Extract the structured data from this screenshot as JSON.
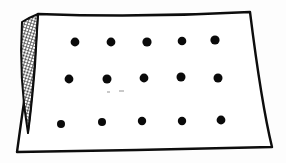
{
  "figure": {
    "kind": "line-drawing",
    "width": 286,
    "height": 163,
    "background_color": "#fdfdfd",
    "paper_fill_color": "#ffffff",
    "ink_color": "#0d0d0d",
    "shading_color": "#1a1a1a"
  },
  "sheet": {
    "name": "paper-sheet",
    "description": "Quadrilateral sheet of paper drawn freehand, slightly skewed",
    "outline_path": "M 38 14 L 250 12 L 272 147 L 17 152 Z",
    "corners": [
      {
        "label": "top-left",
        "x": 38,
        "y": 14
      },
      {
        "label": "top-right",
        "x": 250,
        "y": 12
      },
      {
        "label": "bottom-right",
        "x": 272,
        "y": 147
      },
      {
        "label": "bottom-left",
        "x": 17,
        "y": 152
      }
    ],
    "stroke_width": 2.4
  },
  "curled_edge": {
    "name": "curled-shaded-flap",
    "description": "Tapered cross-hatched strip along the left edge suggesting a lifted or folded page edge",
    "hatch_pattern": "diagonal-cross-hatch",
    "hatch_spacing_px": 3,
    "top_x": 22,
    "top_y": 22,
    "bottom_x": 28,
    "bottom_y": 133,
    "stroke_width": 2.0
  },
  "dot_grid": {
    "name": "dot-grid",
    "rows": 3,
    "columns": 5,
    "total_dots": 15,
    "dot_color": "#0a0a0a",
    "dot_diameter_px": 8,
    "row_labels": [
      "row-1",
      "row-2",
      "row-3"
    ],
    "column_labels": [
      "col-1",
      "col-2",
      "col-3",
      "col-4",
      "col-5"
    ],
    "points": [
      {
        "row": 1,
        "col": 1,
        "x": 75,
        "y": 42,
        "r": 4.4
      },
      {
        "row": 1,
        "col": 2,
        "x": 111,
        "y": 42,
        "r": 4.4
      },
      {
        "row": 1,
        "col": 3,
        "x": 147,
        "y": 42,
        "r": 4.6
      },
      {
        "row": 1,
        "col": 4,
        "x": 182,
        "y": 41,
        "r": 4.3
      },
      {
        "row": 1,
        "col": 5,
        "x": 215,
        "y": 40,
        "r": 4.6
      },
      {
        "row": 2,
        "col": 1,
        "x": 69,
        "y": 79,
        "r": 4.4
      },
      {
        "row": 2,
        "col": 2,
        "x": 107,
        "y": 79,
        "r": 4.5
      },
      {
        "row": 2,
        "col": 3,
        "x": 144,
        "y": 78,
        "r": 4.4
      },
      {
        "row": 2,
        "col": 4,
        "x": 181,
        "y": 77,
        "r": 4.5
      },
      {
        "row": 2,
        "col": 5,
        "x": 218,
        "y": 78,
        "r": 4.5
      },
      {
        "row": 3,
        "col": 1,
        "x": 61,
        "y": 124,
        "r": 4.0
      },
      {
        "row": 3,
        "col": 2,
        "x": 102,
        "y": 122,
        "r": 4.0
      },
      {
        "row": 3,
        "col": 3,
        "x": 142,
        "y": 121,
        "r": 4.2
      },
      {
        "row": 3,
        "col": 4,
        "x": 182,
        "y": 121,
        "r": 4.2
      },
      {
        "row": 3,
        "col": 5,
        "x": 221,
        "y": 120,
        "r": 4.4
      }
    ]
  },
  "faint_marks": {
    "name": "faint-scan-specks",
    "description": "Two very light gray specks below the middle row, scanner artifacts",
    "color": "#c9c9c9",
    "items": [
      {
        "x": 107,
        "y": 91,
        "w": 3,
        "h": 2
      },
      {
        "x": 119,
        "y": 90,
        "w": 5,
        "h": 2
      }
    ]
  }
}
